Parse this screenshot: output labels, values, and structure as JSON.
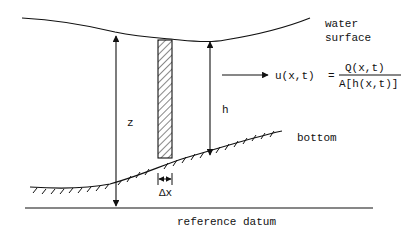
{
  "diagram": {
    "labels": {
      "water_surface_line1": "water",
      "water_surface_line2": "surface",
      "depth": "h",
      "elevation": "z",
      "bottom": "bottom",
      "delta_x": "Δx",
      "reference_datum": "reference datum"
    },
    "equation": {
      "lhs": "u(x,t)",
      "equals": "=",
      "numerator": "Q(x,t)",
      "denominator": "A[h(x,t)]"
    },
    "colors": {
      "stroke": "#111111",
      "background": "#ffffff"
    }
  }
}
